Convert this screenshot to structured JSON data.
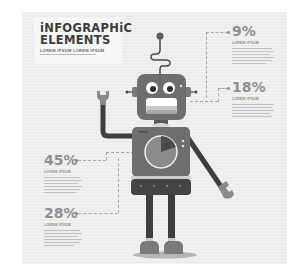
{
  "header": {
    "title_line1": "iNFOGRAPHiC",
    "title_line2": "ELEMENTS",
    "subtitle": "LOREM IPSUM LOREM IPSUM"
  },
  "stats": [
    {
      "id": "stat-9",
      "value": "9%",
      "label": "LOREM IPSUM"
    },
    {
      "id": "stat-18",
      "value": "18%",
      "label": "LOREM IPSUM"
    },
    {
      "id": "stat-45",
      "value": "45%",
      "label": "LOREM IPSUM"
    },
    {
      "id": "stat-28",
      "value": "28%",
      "label": "LOREM IPSUM"
    }
  ],
  "colors": {
    "panel_bg": "#ececec",
    "robot_body": "#6e6e6e",
    "robot_dark": "#444444",
    "accent_gray": "#8f8f8f"
  },
  "illustration": {
    "subject": "robot",
    "holding": "wrench",
    "chest_chart": "pie"
  }
}
